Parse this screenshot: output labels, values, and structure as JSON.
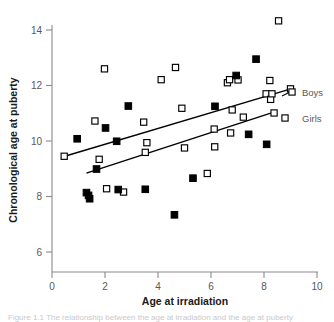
{
  "chart_data": {
    "type": "scatter",
    "title": "",
    "xlabel": "Age at irradiation",
    "ylabel": "Chronological age at puberty",
    "xlim": [
      0,
      10
    ],
    "ylim": [
      5.1,
      14.8
    ],
    "xticks": [
      0,
      2,
      4,
      6,
      8,
      10
    ],
    "yticks": [
      6,
      8,
      10,
      12,
      14
    ],
    "grid": false,
    "legend_position": "right-inside",
    "series": [
      {
        "name": "Boys",
        "marker": "filled-square",
        "color": "#000000",
        "points": [
          [
            0.95,
            10.08
          ],
          [
            1.3,
            8.14
          ],
          [
            1.38,
            8.04
          ],
          [
            1.42,
            7.92
          ],
          [
            1.68,
            8.99
          ],
          [
            2.02,
            10.47
          ],
          [
            2.44,
            9.99
          ],
          [
            2.5,
            8.25
          ],
          [
            2.88,
            11.26
          ],
          [
            3.52,
            8.26
          ],
          [
            4.62,
            7.34
          ],
          [
            5.32,
            8.66
          ],
          [
            6.15,
            11.25
          ],
          [
            6.95,
            12.36
          ],
          [
            7.42,
            10.24
          ],
          [
            7.7,
            12.95
          ],
          [
            8.1,
            9.88
          ]
        ]
      },
      {
        "name": "Girls",
        "marker": "open-square",
        "color": "#000000",
        "points": [
          [
            0.46,
            9.45
          ],
          [
            1.62,
            10.72
          ],
          [
            1.78,
            9.34
          ],
          [
            1.98,
            12.6
          ],
          [
            2.06,
            8.28
          ],
          [
            2.7,
            8.16
          ],
          [
            3.46,
            10.68
          ],
          [
            3.52,
            9.59
          ],
          [
            3.58,
            9.94
          ],
          [
            4.12,
            12.21
          ],
          [
            4.66,
            12.65
          ],
          [
            4.9,
            11.18
          ],
          [
            5.0,
            9.75
          ],
          [
            5.86,
            8.83
          ],
          [
            6.12,
            10.43
          ],
          [
            6.14,
            9.79
          ],
          [
            6.62,
            12.1
          ],
          [
            6.7,
            12.21
          ],
          [
            6.74,
            10.29
          ],
          [
            6.8,
            11.12
          ],
          [
            7.02,
            12.2
          ],
          [
            7.22,
            10.86
          ],
          [
            8.08,
            11.7
          ],
          [
            8.22,
            12.18
          ],
          [
            8.25,
            11.5
          ],
          [
            8.3,
            11.7
          ],
          [
            8.38,
            11.01
          ],
          [
            8.55,
            14.33
          ],
          [
            9.0,
            11.88
          ]
        ]
      }
    ],
    "trendlines": [
      {
        "name": "Boys",
        "x0": 0.45,
        "y0": 9.44,
        "x1": 8.95,
        "y1": 11.86
      },
      {
        "name": "Girls",
        "x0": 1.3,
        "y0": 8.84,
        "x1": 8.4,
        "y1": 11.05
      }
    ],
    "legend": [
      {
        "label": "Boys",
        "marker": "open-square"
      },
      {
        "label": "Girls",
        "marker": "open-square"
      }
    ]
  },
  "axis": {
    "x_title": "Age at irradiation",
    "y_title": "Chronological age at puberty",
    "x_tick_labels": [
      "0",
      "2",
      "4",
      "6",
      "8",
      "10"
    ],
    "y_tick_labels": [
      "6",
      "8",
      "10",
      "12",
      "14"
    ]
  },
  "legend": {
    "boys_label": "Boys",
    "girls_label": "Girls"
  },
  "caption": {
    "text": "Figure 1.1 The relationship between the age at irradiation and the age at puberty"
  },
  "colors": {
    "axis": "#8a8a8d",
    "tick_text": "#58585a",
    "title_text": "#1a1a1a",
    "marker_fill": "#000000",
    "marker_stroke": "#000000",
    "trendline": "#000000",
    "caption_text": "#c9c9cc",
    "background": "#ffffff"
  }
}
